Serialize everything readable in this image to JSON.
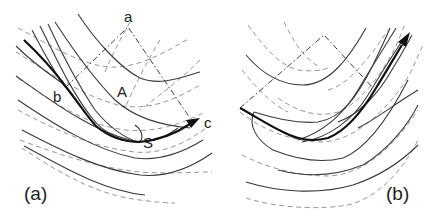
{
  "figure": {
    "panels": [
      {
        "id": "a",
        "caption": "(a)",
        "point_labels": {
          "a": "a",
          "b": "b",
          "c": "c",
          "A": "A",
          "S": "S"
        },
        "elements": {
          "solid_curves": "family of solid contour curves (U/valley shaped)",
          "dashed_curves": "family of dashed contour curves",
          "frame": "dash-dot square with corners a, b, c",
          "path": "bold trajectory from upper-left through b and S, arrow toward c"
        }
      },
      {
        "id": "b",
        "caption": "(b)",
        "point_labels": {},
        "elements": {
          "solid_curves": "family of solid contour curves bending up to the right",
          "dashed_curves": "family of dashed contour curves",
          "frame": "dash-dot square",
          "path": "bold trajectory along valley, arrow pointing up-right"
        }
      }
    ]
  }
}
